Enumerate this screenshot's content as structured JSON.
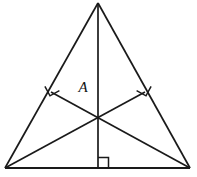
{
  "figure": {
    "kind": "geometry-diagram",
    "background_color": "#ffffff",
    "line_color": "#1a1a1a",
    "stroke_width": 1.6,
    "canvas": {
      "width": 197,
      "height": 177
    },
    "labels": {
      "orthocenter": "A"
    },
    "points": {
      "apex": {
        "x": 98,
        "y": 3
      },
      "bottom_left": {
        "x": 5,
        "y": 168
      },
      "bottom_right": {
        "x": 190,
        "y": 168
      },
      "orthocenter": {
        "x": 98,
        "y": 115
      },
      "foot_left": {
        "x": 51,
        "y": 92
      },
      "foot_right": {
        "x": 145,
        "y": 92
      },
      "foot_base": {
        "x": 98,
        "y": 168
      }
    },
    "segments": [
      {
        "name": "side-left",
        "from": "apex",
        "to": "bottom_left"
      },
      {
        "name": "side-right",
        "from": "apex",
        "to": "bottom_right"
      },
      {
        "name": "base",
        "from": "bottom_left",
        "to": "bottom_right"
      },
      {
        "name": "altitude-from-apex",
        "from": "apex",
        "to": "foot_base"
      },
      {
        "name": "altitude-from-bottom-right",
        "from": "bottom_right",
        "to": "foot_left"
      },
      {
        "name": "altitude-from-bottom-left",
        "from": "bottom_left",
        "to": "foot_right"
      }
    ],
    "right_angle_marks": [
      {
        "name": "right-angle-at-foot-left",
        "at": "foot_left",
        "size": 9
      },
      {
        "name": "right-angle-at-foot-right",
        "at": "foot_right",
        "size": 9
      },
      {
        "name": "right-angle-at-base",
        "at": "foot_base",
        "size": 10
      }
    ],
    "label_positions": {
      "orthocenter_label": {
        "x": 83,
        "y": 92
      }
    }
  }
}
